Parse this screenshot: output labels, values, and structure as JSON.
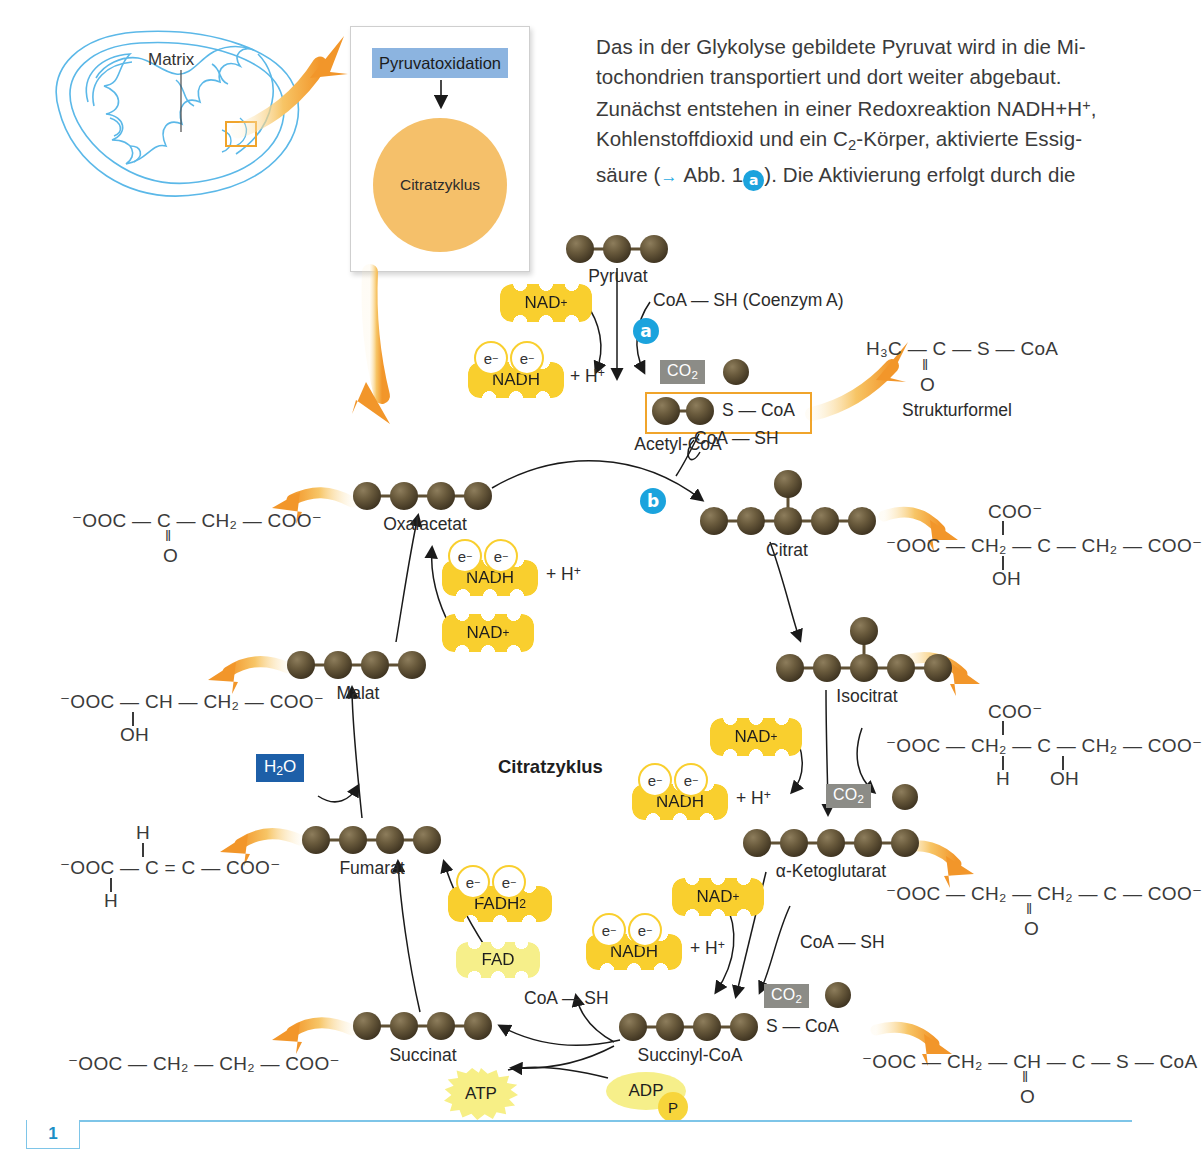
{
  "intro": {
    "line1": "Das in der Glykolyse gebildete Pyruvat wird in die Mi-",
    "line2": "tochondrien transportiert und dort weiter abgebaut.",
    "line3_a": "Zunächst entstehen in einer Redoxreaktion NADH",
    "line3_b": "+H",
    "line3_c": ", Kohlenstoffdioxid und ein C",
    "line3_d": "-Körper, aktivierte Essig-",
    "line4_a": "säure (",
    "line4_b": "Abb. 1",
    "marker_a": "a",
    "line4_c": "). Die Aktivierung erfolgt durch die"
  },
  "mitochondrion": {
    "matrix_label": "Matrix"
  },
  "inset": {
    "pyruvate_oxidation": "Pyruvatoxidation",
    "citrate_cycle": "Citratzyklus"
  },
  "cycle": {
    "title": "Citratzyklus"
  },
  "markers": {
    "a": "a",
    "b": "b"
  },
  "metabolites": {
    "pyruvat": {
      "label": "Pyruvat",
      "carbons": 3
    },
    "acetyl_coa": {
      "label": "Acetyl-CoA",
      "carbons": 2,
      "tail": "S — CoA"
    },
    "oxalacetat": {
      "label": "Oxalacetat",
      "carbons": 4
    },
    "citrat": {
      "label": "Citrat",
      "carbons": 6
    },
    "isocitrat": {
      "label": "Isocitrat",
      "carbons": 6
    },
    "ketoglutarat": {
      "label": "α-Ketoglutarat",
      "carbons": 5
    },
    "succinyl_coa": {
      "label": "Succinyl-CoA",
      "carbons": 4,
      "tail": "S — CoA"
    },
    "succinat": {
      "label": "Succinat",
      "carbons": 4
    },
    "fumarat": {
      "label": "Fumarat",
      "carbons": 4
    },
    "malat": {
      "label": "Malat",
      "carbons": 4
    }
  },
  "cofactors": {
    "nad_plus": "NAD",
    "nad_plus_sup": "+",
    "nadh": "NADH",
    "electron": "e",
    "electron_sup": "−",
    "plus_h": "+ H",
    "plus_h_sup": "+",
    "fad": "FAD",
    "fadh2": "FADH",
    "fadh2_sub": "2",
    "co2": "CO",
    "co2_sub": "2",
    "h2o": "H",
    "h2o_sub": "2",
    "h2o_tail": "O",
    "atp": "ATP",
    "adp": "ADP",
    "phosphate": "P",
    "coa_sh": "CoA — SH",
    "coa_sh_full": "CoA — SH  (Coenzym A)"
  },
  "formulas": {
    "strukturformel_caption": "Strukturformel",
    "acetyl_coa": {
      "top": "H₃C — C — S — CoA",
      "bond": "‖",
      "bottom": "O"
    },
    "oxalacetat": {
      "top": "⁻OOC — C — CH₂ — COO⁻",
      "bond": "‖",
      "bottom": "O"
    },
    "citrat": {
      "upper": "COO⁻",
      "main": "⁻OOC — CH₂ — C — CH₂ — COO⁻",
      "lower": "OH"
    },
    "isocitrat": {
      "upper": "COO⁻",
      "main": "⁻OOC — CH₂ — C — CH₂ — COO⁻",
      "lower_left": "H",
      "lower_right": "OH"
    },
    "ketoglutarat": {
      "main": "⁻OOC — CH₂ — CH₂ — C — COO⁻",
      "bond": "‖",
      "bottom": "O"
    },
    "succinyl_coa": {
      "main": "⁻OOC — CH₂ — CH — C — S — CoA",
      "bond": "‖",
      "bottom": "O"
    },
    "succinat": {
      "main": "⁻OOC — CH₂ — CH₂ — COO⁻"
    },
    "fumarat": {
      "top": "H",
      "main": "⁻OOC — C = C — COO⁻",
      "bottom": "H"
    },
    "malat": {
      "main": "⁻OOC — CH — CH₂ — COO⁻",
      "lower": "OH"
    }
  },
  "footer": {
    "figure_number": "1"
  },
  "colors": {
    "accent_blue": "#1ba3dd",
    "mito_outline": "#5bb8e8",
    "carbon": "#5f5034",
    "cofactor_yellow": "#f9cf2e",
    "cofactor_pale": "#f6ef8a",
    "arrow_orange": "#f2a33c",
    "inset_header": "#8cb4e0",
    "citrate_circle": "#f5c06a",
    "co2_gray": "#8c8c87",
    "h2o_blue": "#1d5fa8",
    "highlight_orange": "#f0a42b",
    "footer_blue": "#7ec5e8"
  }
}
